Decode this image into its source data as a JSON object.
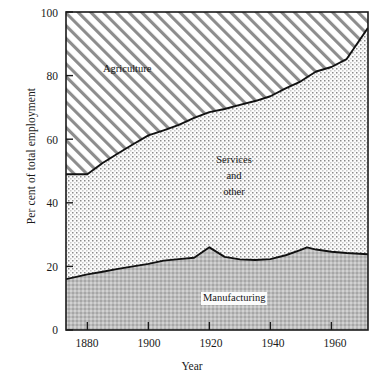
{
  "chart_data": {
    "type": "area",
    "title": "",
    "subtitle": "",
    "xlabel": "Year",
    "ylabel": "Per cent of total employment",
    "xlim": [
      1873,
      1972
    ],
    "ylim": [
      0,
      100
    ],
    "grid": false,
    "legend_position": "inline-annotations",
    "stacked": true,
    "xticks": [
      1880,
      1900,
      1920,
      1940,
      1960
    ],
    "xtick_labels": [
      "1880",
      "1900",
      "1920",
      "1940",
      "1960"
    ],
    "yticks": [
      0,
      20,
      40,
      60,
      80,
      100
    ],
    "ytick_labels": [
      "0",
      "20",
      "40",
      "60",
      "80",
      "100"
    ],
    "x": [
      1873,
      1880,
      1885,
      1890,
      1895,
      1900,
      1905,
      1910,
      1915,
      1920,
      1925,
      1930,
      1935,
      1940,
      1945,
      1950,
      1952,
      1955,
      1960,
      1965,
      1972
    ],
    "series": [
      {
        "name": "Manufacturing",
        "annotation": "Manufacturing",
        "fill": "#b4b4b4",
        "pattern": "fine-checker-dark",
        "values": [
          16.0,
          17.5,
          18.3,
          19.2,
          20.0,
          20.8,
          21.8,
          22.3,
          22.7,
          26.0,
          23.0,
          22.2,
          22.0,
          22.3,
          23.5,
          25.2,
          26.0,
          25.3,
          24.6,
          24.2,
          23.8
        ]
      },
      {
        "name": "Services and other",
        "annotation": "Services\nand\nother",
        "fill": "#f2f2f2",
        "pattern": "dotted-stipple",
        "values": [
          33.0,
          31.5,
          34.2,
          36.3,
          38.4,
          40.4,
          41.0,
          42.2,
          44.0,
          42.5,
          46.5,
          48.6,
          50.0,
          51.2,
          52.5,
          53.0,
          53.5,
          56.0,
          58.1,
          61.0,
          71.2
        ]
      },
      {
        "name": "Agriculture",
        "annotation": "Agriculture",
        "fill": "#ffffff",
        "pattern": "diagonal-hatch",
        "values": [
          51.0,
          51.0,
          47.5,
          44.5,
          41.6,
          38.8,
          37.2,
          35.5,
          33.3,
          31.5,
          30.5,
          29.2,
          28.0,
          26.5,
          24.0,
          21.8,
          20.5,
          18.7,
          17.3,
          14.8,
          5.0
        ]
      }
    ],
    "boundaries": {
      "manufacturing_top": [
        16.0,
        17.5,
        18.3,
        19.2,
        20.0,
        20.8,
        21.8,
        22.3,
        22.7,
        26.0,
        23.0,
        22.2,
        22.0,
        22.3,
        23.5,
        25.2,
        26.0,
        25.3,
        24.6,
        24.2,
        23.8
      ],
      "services_top": [
        49.0,
        49.0,
        52.5,
        55.5,
        58.4,
        61.2,
        62.8,
        64.5,
        66.7,
        68.5,
        69.5,
        70.8,
        72.0,
        73.5,
        76.0,
        78.2,
        79.5,
        81.3,
        82.7,
        85.2,
        95.0
      ]
    },
    "annotations": [
      {
        "text": "Agriculture",
        "x": 1890,
        "y": 86
      },
      {
        "text": "Services",
        "x": 1931,
        "y": 48
      },
      {
        "text": "and",
        "x": 1931,
        "y": 43
      },
      {
        "text": "other",
        "x": 1931,
        "y": 38
      },
      {
        "text": "Manufacturing",
        "x": 1932,
        "y": 10
      }
    ]
  },
  "axis": {
    "ylabel": "Per cent of total employment",
    "xlabel": "Year",
    "ytick_labels": [
      "100",
      "80",
      "60",
      "40",
      "20",
      "0"
    ],
    "xtick_labels": [
      "1880",
      "1900",
      "1920",
      "1940",
      "1960"
    ]
  },
  "labels": {
    "agriculture": "Agriculture",
    "services_line1": "Services",
    "services_line2": "and",
    "services_line3": "other",
    "manufacturing": "Manufacturing"
  },
  "colors": {
    "axis": "#1a1a1a",
    "manufacturing_fill": "#b4b4b4",
    "services_fill": "#f2f2f2",
    "agriculture_fill": "#ffffff",
    "boundary_line": "#111111"
  }
}
